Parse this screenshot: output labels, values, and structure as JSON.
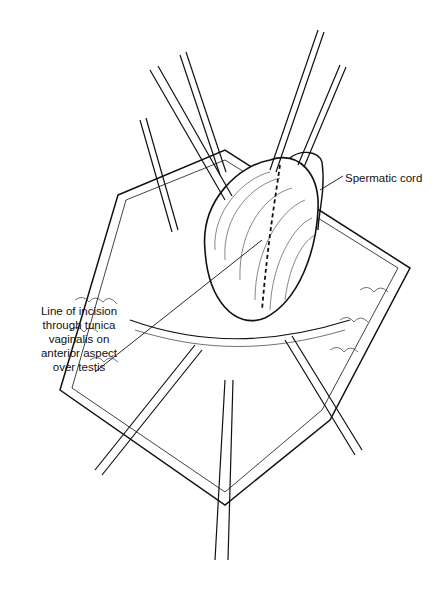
{
  "figure": {
    "type": "surgical illustration",
    "labels": [
      {
        "id": "spermatic-cord",
        "text": "Spermatic cord"
      },
      {
        "id": "incision-line",
        "text": "Line of incision through tunica vaginalis on anterior aspect over testis",
        "lines": [
          "Line of incision",
          "through tunica",
          "vaginalis on",
          "anterior aspect",
          "over testis"
        ]
      }
    ],
    "colors": {
      "ink": "#111111",
      "background": "#ffffff"
    }
  }
}
